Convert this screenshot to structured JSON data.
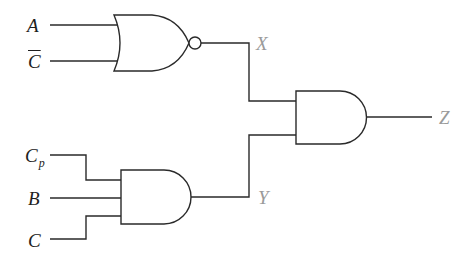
{
  "diagram": {
    "type": "logic-circuit",
    "inputs": [
      {
        "id": "A",
        "label": "A"
      },
      {
        "id": "C_bar",
        "label": "C",
        "overline": true
      },
      {
        "id": "Cp",
        "label": "C",
        "subscript": "p"
      },
      {
        "id": "B",
        "label": "B"
      },
      {
        "id": "C",
        "label": "C"
      }
    ],
    "gates": [
      {
        "id": "G1",
        "kind": "NOR",
        "inputs": [
          "A",
          "C_bar"
        ],
        "output": "X"
      },
      {
        "id": "G2",
        "kind": "AND",
        "inputs": [
          "Cp",
          "B",
          "C"
        ],
        "output": "Y"
      },
      {
        "id": "G3",
        "kind": "AND",
        "inputs": [
          "X",
          "Y"
        ],
        "output": "Z"
      }
    ],
    "intermediate_labels": {
      "x": "X",
      "y": "Y"
    },
    "output_label": "Z",
    "colors": {
      "wire": "#2a2a2a",
      "input_label": "#1e1e1e",
      "signal_label": "#9a9a9a"
    }
  }
}
